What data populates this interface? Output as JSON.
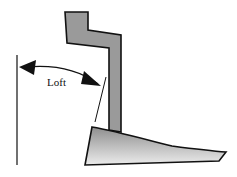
{
  "diagram": {
    "labels": {
      "loft": "Loft"
    },
    "colors": {
      "shaft": "#9a9a9a",
      "outline": "#111111",
      "head_light": "#e8e8e8",
      "head_dark": "#8c8c8c"
    }
  }
}
